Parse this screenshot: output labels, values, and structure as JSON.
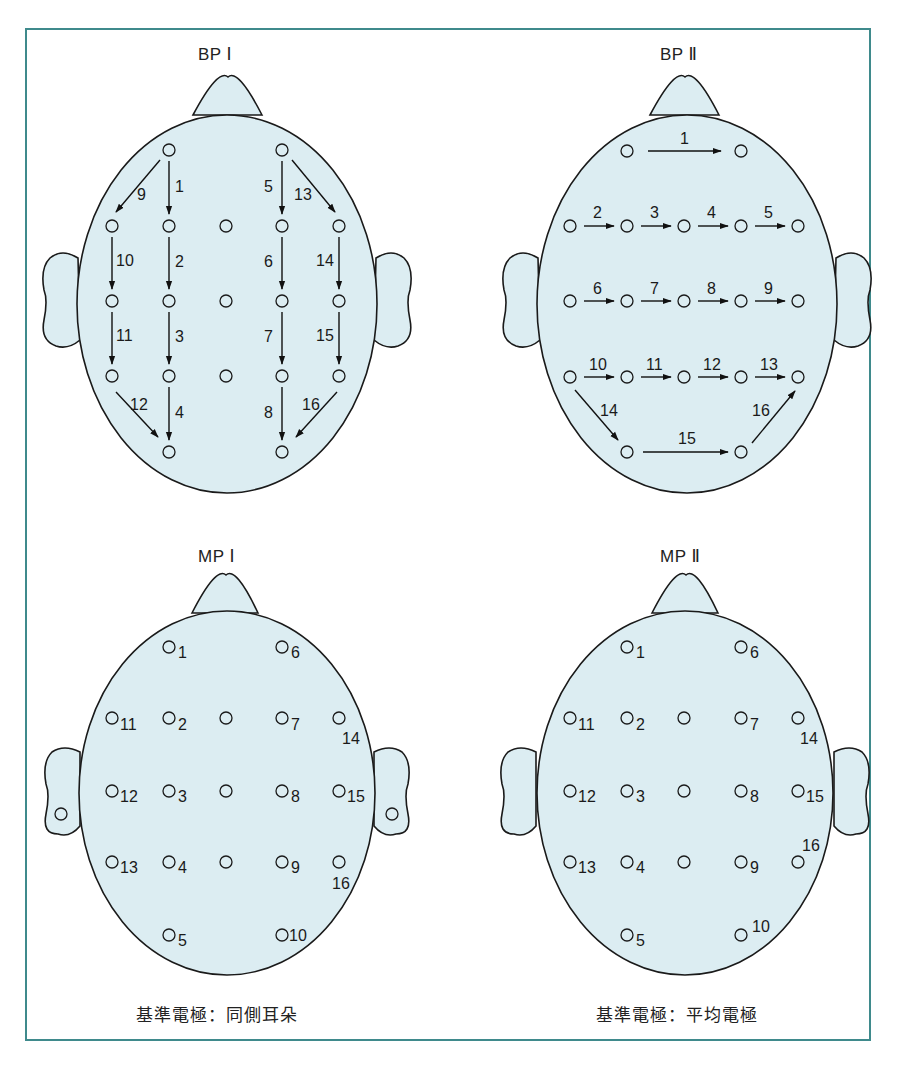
{
  "panels": {
    "bp1": {
      "title": "BP Ⅰ"
    },
    "bp2": {
      "title": "BP Ⅱ"
    },
    "mp1": {
      "title": "MP Ⅰ",
      "caption": "基準電極：同側耳朵"
    },
    "mp2": {
      "title": "MP Ⅱ",
      "caption": "基準電極：平均電極"
    }
  },
  "colors": {
    "frame": "#3f8a8c",
    "head_fill": "#dcedf2",
    "stroke": "#1a1a1a"
  },
  "bp1_arrows": [
    {
      "n": "1",
      "from": [
        169,
        150
      ],
      "to": [
        169,
        226
      ]
    },
    {
      "n": "2",
      "from": [
        169,
        226
      ],
      "to": [
        169,
        301
      ]
    },
    {
      "n": "3",
      "from": [
        169,
        301
      ],
      "to": [
        169,
        376
      ]
    },
    {
      "n": "4",
      "from": [
        169,
        376
      ],
      "to": [
        169,
        452
      ]
    },
    {
      "n": "5",
      "from": [
        282,
        150
      ],
      "to": [
        282,
        226
      ]
    },
    {
      "n": "6",
      "from": [
        282,
        226
      ],
      "to": [
        282,
        301
      ]
    },
    {
      "n": "7",
      "from": [
        282,
        301
      ],
      "to": [
        282,
        376
      ]
    },
    {
      "n": "8",
      "from": [
        282,
        376
      ],
      "to": [
        282,
        452
      ]
    },
    {
      "n": "9",
      "from": [
        169,
        150
      ],
      "to": [
        112,
        226
      ]
    },
    {
      "n": "10",
      "from": [
        112,
        226
      ],
      "to": [
        112,
        301
      ]
    },
    {
      "n": "11",
      "from": [
        112,
        301
      ],
      "to": [
        112,
        376
      ]
    },
    {
      "n": "12",
      "from": [
        112,
        376
      ],
      "to": [
        169,
        452
      ]
    },
    {
      "n": "13",
      "from": [
        282,
        150
      ],
      "to": [
        339,
        226
      ]
    },
    {
      "n": "14",
      "from": [
        339,
        226
      ],
      "to": [
        339,
        301
      ]
    },
    {
      "n": "15",
      "from": [
        339,
        301
      ],
      "to": [
        339,
        376
      ]
    },
    {
      "n": "16",
      "from": [
        339,
        376
      ],
      "to": [
        282,
        452
      ]
    }
  ],
  "bp2_arrows": [
    {
      "n": "1"
    },
    {
      "n": "2"
    },
    {
      "n": "3"
    },
    {
      "n": "4"
    },
    {
      "n": "5"
    },
    {
      "n": "6"
    },
    {
      "n": "7"
    },
    {
      "n": "8"
    },
    {
      "n": "9"
    },
    {
      "n": "10"
    },
    {
      "n": "11"
    },
    {
      "n": "12"
    },
    {
      "n": "13"
    },
    {
      "n": "14"
    },
    {
      "n": "15"
    },
    {
      "n": "16"
    }
  ],
  "mp1_electrode_labels": [
    "1",
    "2",
    "3",
    "4",
    "5",
    "6",
    "7",
    "8",
    "9",
    "10",
    "11",
    "12",
    "13",
    "14",
    "15",
    "16"
  ],
  "mp2_electrode_labels": [
    "1",
    "2",
    "3",
    "4",
    "5",
    "6",
    "7",
    "8",
    "9",
    "10",
    "11",
    "12",
    "13",
    "14",
    "15",
    "16"
  ]
}
